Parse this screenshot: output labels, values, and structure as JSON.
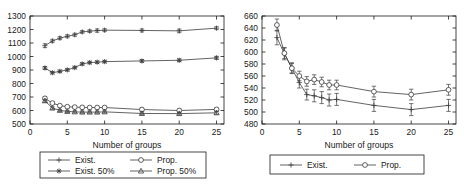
{
  "figure": {
    "panels": [
      {
        "id": "left",
        "xlabel": "Number of groups",
        "ylabel": "",
        "xlim": [
          0,
          26
        ],
        "ylim": [
          500,
          1300
        ],
        "xticks": [
          0,
          5,
          10,
          15,
          20,
          25
        ],
        "yticks": [
          500,
          600,
          700,
          800,
          900,
          1000,
          1100,
          1200,
          1300
        ],
        "legend": [
          {
            "label": "Exist.",
            "marker": "plus"
          },
          {
            "label": "Prop.",
            "marker": "circle"
          },
          {
            "label": "Exist. 50%",
            "marker": "star"
          },
          {
            "label": "Prop. 50%",
            "marker": "triangle"
          }
        ]
      },
      {
        "id": "right",
        "xlabel": "Number of groups",
        "ylabel": "",
        "xlim": [
          0,
          26
        ],
        "ylim": [
          480,
          660
        ],
        "xticks": [
          0,
          5,
          10,
          15,
          20,
          25
        ],
        "yticks": [
          480,
          500,
          520,
          540,
          560,
          580,
          600,
          620,
          640,
          660
        ],
        "legend": [
          {
            "label": "Exist.",
            "marker": "plus"
          },
          {
            "label": "Prop.",
            "marker": "circle"
          }
        ]
      }
    ]
  },
  "chart_data": [
    {
      "type": "line",
      "title": "",
      "xlabel": "Number of groups",
      "ylabel": "",
      "xlim": [
        0,
        26
      ],
      "ylim": [
        500,
        1300
      ],
      "xticks": [
        0,
        5,
        10,
        15,
        20,
        25
      ],
      "yticks": [
        500,
        600,
        700,
        800,
        900,
        1000,
        1100,
        1200,
        1300
      ],
      "grid": false,
      "legend_position": "below-axes",
      "x": [
        2,
        3,
        4,
        5,
        6,
        7,
        8,
        9,
        10,
        15,
        20,
        25
      ],
      "series": [
        {
          "name": "Exist.",
          "marker": "plus",
          "values": [
            1080,
            1115,
            1136,
            1150,
            1161,
            1182,
            1188,
            1192,
            1195,
            1193,
            1190,
            1210
          ],
          "errors": [
            14,
            12,
            11,
            11,
            11,
            10,
            10,
            12,
            11,
            11,
            13,
            11
          ]
        },
        {
          "name": "Prop.",
          "marker": "circle",
          "values": [
            690,
            655,
            636,
            628,
            625,
            623,
            622,
            622,
            622,
            607,
            600,
            608
          ],
          "errors": [
            12,
            10,
            9,
            9,
            9,
            9,
            9,
            9,
            9,
            11,
            11,
            12
          ]
        },
        {
          "name": "Exist. 50%",
          "marker": "star",
          "values": [
            915,
            880,
            890,
            901,
            918,
            945,
            955,
            958,
            962,
            967,
            972,
            990
          ],
          "errors": [
            11,
            9,
            9,
            9,
            9,
            9,
            9,
            9,
            9,
            10,
            10,
            11
          ]
        },
        {
          "name": "Prop. 50%",
          "marker": "triangle",
          "values": [
            672,
            618,
            601,
            593,
            590,
            588,
            588,
            588,
            590,
            578,
            577,
            583
          ],
          "errors": [
            11,
            9,
            8,
            8,
            8,
            8,
            8,
            8,
            8,
            10,
            10,
            11
          ]
        }
      ]
    },
    {
      "type": "line",
      "title": "",
      "xlabel": "Number of groups",
      "ylabel": "",
      "xlim": [
        0,
        26
      ],
      "ylim": [
        480,
        660
      ],
      "xticks": [
        0,
        5,
        10,
        15,
        20,
        25
      ],
      "yticks": [
        480,
        500,
        520,
        540,
        560,
        580,
        600,
        620,
        640,
        660
      ],
      "grid": false,
      "legend_position": "below-axes",
      "x": [
        2,
        3,
        4,
        5,
        6,
        7,
        8,
        9,
        10,
        15,
        20,
        25
      ],
      "series": [
        {
          "name": "Exist.",
          "marker": "plus",
          "values": [
            624,
            597,
            573,
            549,
            529,
            527,
            524,
            520,
            521,
            511,
            504,
            511
          ],
          "errors": [
            12,
            10,
            9,
            9,
            9,
            10,
            10,
            10,
            10,
            10,
            10,
            10
          ]
        },
        {
          "name": "Prop.",
          "marker": "circle",
          "values": [
            645,
            598,
            573,
            560,
            551,
            554,
            550,
            545,
            545,
            534,
            529,
            537
          ],
          "errors": [
            10,
            9,
            8,
            8,
            8,
            8,
            8,
            8,
            8,
            9,
            9,
            9
          ]
        }
      ]
    }
  ]
}
